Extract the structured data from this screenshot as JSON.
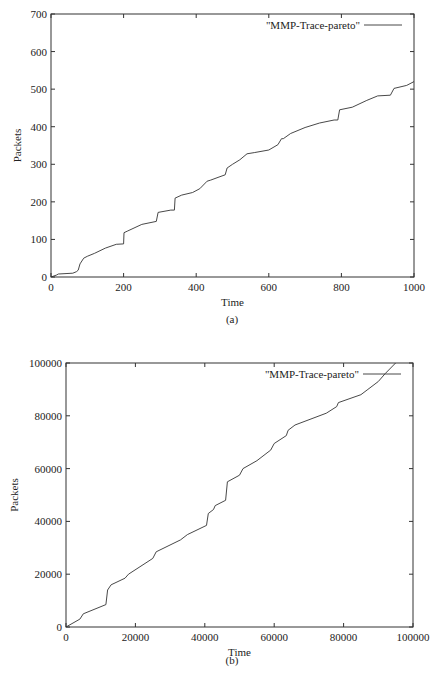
{
  "chart_data": [
    {
      "type": "line",
      "panel": "(a)",
      "title": "",
      "xlabel": "Time",
      "ylabel": "Packets",
      "xlim": [
        0,
        1000
      ],
      "ylim": [
        0,
        700
      ],
      "xticks": [
        "0",
        "200",
        "400",
        "600",
        "800",
        "1000"
      ],
      "yticks": [
        "0",
        "100",
        "200",
        "300",
        "400",
        "500",
        "600",
        "700"
      ],
      "legend": {
        "position": "top-right",
        "entries": [
          "\"MMP-Trace-pareto\""
        ]
      },
      "grid": false,
      "series": [
        {
          "name": "\"MMP-Trace-pareto\"",
          "x": [
            0,
            15,
            20,
            60,
            70,
            75,
            80,
            90,
            100,
            120,
            150,
            180,
            200,
            201,
            210,
            250,
            290,
            295,
            330,
            340,
            342,
            360,
            390,
            410,
            430,
            440,
            460,
            480,
            485,
            500,
            520,
            540,
            560,
            600,
            625,
            635,
            640,
            660,
            700,
            740,
            780,
            790,
            795,
            830,
            870,
            900,
            935,
            945,
            980,
            1000
          ],
          "y": [
            0,
            5,
            8,
            10,
            14,
            18,
            35,
            50,
            55,
            63,
            77,
            87,
            88,
            118,
            122,
            140,
            148,
            172,
            178,
            178,
            210,
            218,
            225,
            235,
            255,
            258,
            265,
            272,
            290,
            300,
            312,
            328,
            331,
            338,
            352,
            368,
            368,
            382,
            398,
            410,
            418,
            418,
            445,
            452,
            470,
            482,
            484,
            502,
            510,
            520
          ]
        }
      ]
    },
    {
      "type": "line",
      "panel": "(b)",
      "title": "",
      "xlabel": "Time",
      "ylabel": "Packets",
      "xlim": [
        0,
        100000
      ],
      "ylim": [
        0,
        100000
      ],
      "xticks": [
        "0",
        "20000",
        "40000",
        "60000",
        "80000",
        "100000"
      ],
      "yticks": [
        "0",
        "20000",
        "40000",
        "60000",
        "80000",
        "100000"
      ],
      "legend": {
        "position": "top-right",
        "entries": [
          "\"MMP-Trace-pareto\""
        ]
      },
      "grid": false,
      "series": [
        {
          "name": "\"MMP-Trace-pareto\"",
          "x": [
            0,
            4000,
            5000,
            11500,
            12000,
            13000,
            17000,
            18000,
            25000,
            26000,
            33000,
            35000,
            40500,
            41000,
            42500,
            43000,
            46000,
            46500,
            50000,
            51000,
            55000,
            59000,
            60000,
            63500,
            64000,
            66000,
            75000,
            78000,
            78500,
            85000,
            87000,
            90000,
            92000,
            95000
          ],
          "y": [
            0,
            3000,
            5000,
            8500,
            14000,
            16000,
            18500,
            20000,
            26000,
            28500,
            33000,
            35000,
            38500,
            43000,
            44500,
            46000,
            48000,
            55000,
            57500,
            60000,
            63000,
            67000,
            69500,
            72500,
            74500,
            76500,
            81000,
            83500,
            85000,
            88000,
            90000,
            93000,
            96000,
            100000
          ]
        }
      ]
    }
  ],
  "panels": {
    "a": {
      "caption": "(a)",
      "xlabel": "Time",
      "ylabel": "Packets",
      "legend_label": "\"MMP-Trace-pareto\""
    },
    "b": {
      "caption": "(b)",
      "xlabel": "Time",
      "ylabel": "Packets",
      "legend_label": "\"MMP-Trace-pareto\""
    }
  },
  "footer": {
    "text": "Figure 11.3   Cumulative packet arrivals for MMP trace with Pareto distribution"
  },
  "colors": {
    "line": "#333333",
    "frame": "#333333",
    "background": "#ffffff"
  }
}
